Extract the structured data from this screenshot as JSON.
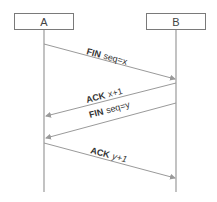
{
  "diagram": {
    "type": "sequence",
    "participants": [
      {
        "id": "A",
        "label": "A"
      },
      {
        "id": "B",
        "label": "B"
      }
    ],
    "messages": [
      {
        "from": "A",
        "to": "B",
        "keyword": "FIN",
        "detail": "seq=x"
      },
      {
        "from": "B",
        "to": "A",
        "keyword": "ACK",
        "detail": "x+1"
      },
      {
        "from": "B",
        "to": "A",
        "keyword": "FIN",
        "detail": "seq=y"
      },
      {
        "from": "A",
        "to": "B",
        "keyword": "ACK",
        "detail": "y+1"
      }
    ],
    "colors": {
      "line": "#9a9a9a",
      "box_border": "#7a7a7a",
      "text": "#333333"
    }
  }
}
